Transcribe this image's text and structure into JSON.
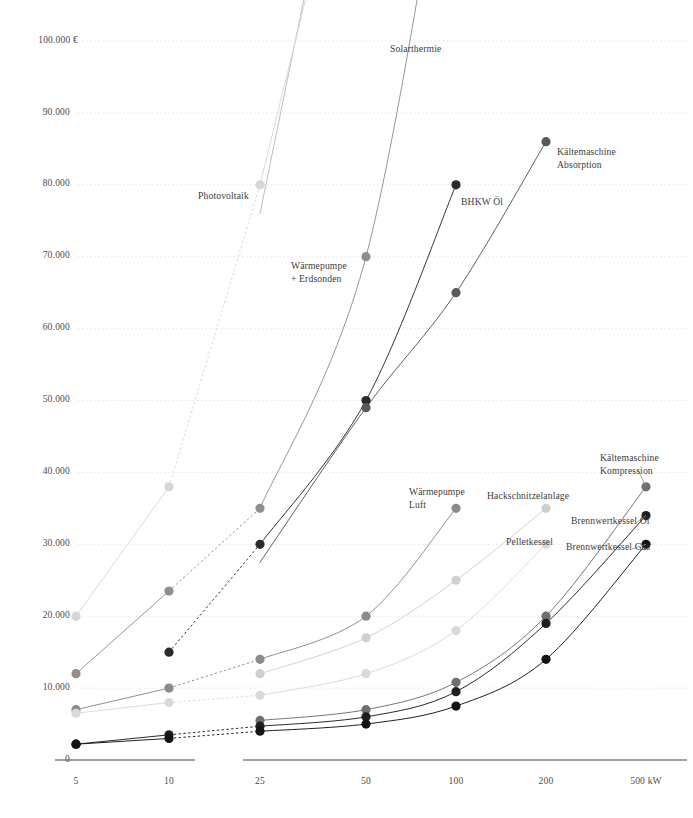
{
  "chart_data": {
    "type": "line",
    "title": "",
    "xlabel": "",
    "ylabel": "",
    "currency_symbol": "€",
    "y_axis": {
      "ticks": [
        0,
        10000,
        20000,
        30000,
        40000,
        50000,
        60000,
        70000,
        80000,
        90000,
        100000
      ],
      "tick_labels": [
        "0",
        "10.000",
        "20.000",
        "30.000",
        "40.000",
        "50.000",
        "60.000",
        "70.000",
        "80.000",
        "90.000",
        "100.000 €"
      ],
      "ylim": [
        0,
        100000
      ],
      "grid": true
    },
    "x_axis": {
      "categories": [
        "5",
        "10",
        "25",
        "50",
        "100",
        "200",
        "500"
      ],
      "tick_labels": [
        "5",
        "10",
        "25",
        "50",
        "100",
        "200",
        "500 kW"
      ],
      "unit": "kW",
      "break_after_index": 1,
      "grid": false
    },
    "legend": {
      "position": "inline-annotations"
    },
    "series": [
      {
        "name": "Solarthermie",
        "color": "#b9b9b9",
        "label_pos": {
          "x": 390,
          "y": 43
        },
        "points": [
          {
            "x": "25",
            "y": 76000
          },
          {
            "x": "50",
            "y": 148000
          }
        ],
        "visible_points": []
      },
      {
        "name": "Photovoltaik",
        "color": "#d6d6d6",
        "label_pos": {
          "x": 198,
          "y": 190
        },
        "points": [
          {
            "x": "5",
            "y": 20000
          },
          {
            "x": "10",
            "y": 38000
          },
          {
            "x": "25",
            "y": 80000
          },
          {
            "x": "50",
            "y": 140000
          }
        ],
        "visible_points": [
          {
            "x": "5",
            "y": 20000
          },
          {
            "x": "10",
            "y": 38000
          },
          {
            "x": "25",
            "y": 80000
          }
        ]
      },
      {
        "name": "Wärmepumpe + Erdsonden",
        "color": "#8f8f8f",
        "label_pos": {
          "x": 291,
          "y": 262
        },
        "points": [
          {
            "x": "5",
            "y": 12000
          },
          {
            "x": "10",
            "y": 23500
          },
          {
            "x": "25",
            "y": 35000
          },
          {
            "x": "50",
            "y": 70000
          },
          {
            "x": "100",
            "y": 138000
          }
        ],
        "visible_points": [
          {
            "x": "5",
            "y": 12000
          },
          {
            "x": "10",
            "y": 23500
          },
          {
            "x": "25",
            "y": 35000
          },
          {
            "x": "50",
            "y": 70000
          }
        ]
      },
      {
        "name": "BHKW Öl",
        "color": "#2b2b2b",
        "label_pos": {
          "x": 461,
          "y": 197
        },
        "points": [
          {
            "x": "10",
            "y": 15000
          },
          {
            "x": "25",
            "y": 30000
          },
          {
            "x": "50",
            "y": 50000
          },
          {
            "x": "100",
            "y": 80000
          }
        ],
        "visible_points": [
          {
            "x": "10",
            "y": 15000
          },
          {
            "x": "25",
            "y": 30000
          },
          {
            "x": "50",
            "y": 50000
          },
          {
            "x": "100",
            "y": 80000
          }
        ]
      },
      {
        "name": "Kältemaschine Absorption",
        "color": "#585858",
        "label_pos": {
          "x": 557,
          "y": 146
        },
        "points": [
          {
            "x": "25",
            "y": 27500
          },
          {
            "x": "50",
            "y": 49000
          },
          {
            "x": "100",
            "y": 65000
          },
          {
            "x": "200",
            "y": 86000
          }
        ],
        "visible_points": [
          {
            "x": "50",
            "y": 49000
          },
          {
            "x": "100",
            "y": 65000
          },
          {
            "x": "200",
            "y": 86000
          }
        ]
      },
      {
        "name": "Wärmepumpe Luft",
        "color": "#8a8a8a",
        "label_pos": {
          "x": 409,
          "y": 488
        },
        "points": [
          {
            "x": "5",
            "y": 7000
          },
          {
            "x": "10",
            "y": 10000
          },
          {
            "x": "25",
            "y": 14000
          },
          {
            "x": "50",
            "y": 20000
          },
          {
            "x": "100",
            "y": 35000
          }
        ],
        "visible_points": [
          {
            "x": "5",
            "y": 7000
          },
          {
            "x": "10",
            "y": 10000
          },
          {
            "x": "25",
            "y": 14000
          },
          {
            "x": "50",
            "y": 20000
          },
          {
            "x": "100",
            "y": 35000
          }
        ]
      },
      {
        "name": "Hackschnitzelanlage",
        "color": "#cfcfcf",
        "label_pos": {
          "x": 487,
          "y": 492
        },
        "points": [
          {
            "x": "25",
            "y": 12000
          },
          {
            "x": "50",
            "y": 17000
          },
          {
            "x": "100",
            "y": 25000
          },
          {
            "x": "200",
            "y": 35000
          }
        ],
        "visible_points": [
          {
            "x": "25",
            "y": 12000
          },
          {
            "x": "50",
            "y": 17000
          },
          {
            "x": "100",
            "y": 25000
          },
          {
            "x": "200",
            "y": 35000
          }
        ]
      },
      {
        "name": "Pelletkessel",
        "color": "#d9d9d9",
        "label_pos": {
          "x": 506,
          "y": 538
        },
        "points": [
          {
            "x": "5",
            "y": 6500
          },
          {
            "x": "10",
            "y": 8000
          },
          {
            "x": "25",
            "y": 9000
          },
          {
            "x": "50",
            "y": 12000
          },
          {
            "x": "100",
            "y": 18000
          },
          {
            "x": "200",
            "y": 30000
          }
        ],
        "visible_points": [
          {
            "x": "5",
            "y": 6500
          },
          {
            "x": "10",
            "y": 8000
          },
          {
            "x": "25",
            "y": 9000
          },
          {
            "x": "50",
            "y": 12000
          },
          {
            "x": "100",
            "y": 18000
          },
          {
            "x": "200",
            "y": 30000
          }
        ]
      },
      {
        "name": "Kältemaschine Kompression",
        "color": "#6f6f6f",
        "label_pos": {
          "x": 600,
          "y": 455
        },
        "points": [
          {
            "x": "25",
            "y": 5500
          },
          {
            "x": "50",
            "y": 7000
          },
          {
            "x": "100",
            "y": 10800
          },
          {
            "x": "200",
            "y": 20000
          },
          {
            "x": "500",
            "y": 38000
          }
        ],
        "visible_points": [
          {
            "x": "25",
            "y": 5500
          },
          {
            "x": "50",
            "y": 7000
          },
          {
            "x": "100",
            "y": 10800
          },
          {
            "x": "200",
            "y": 20000
          },
          {
            "x": "500",
            "y": 38000
          }
        ]
      },
      {
        "name": "Brennwertkessel Öl",
        "color": "#1f1f1f",
        "label_pos": {
          "x": 571,
          "y": 517
        },
        "points": [
          {
            "x": "5",
            "y": 2200
          },
          {
            "x": "10",
            "y": 3500
          },
          {
            "x": "25",
            "y": 4700
          },
          {
            "x": "50",
            "y": 6000
          },
          {
            "x": "100",
            "y": 9500
          },
          {
            "x": "200",
            "y": 19000
          },
          {
            "x": "500",
            "y": 34000
          }
        ],
        "visible_points": [
          {
            "x": "5",
            "y": 2200
          },
          {
            "x": "10",
            "y": 3500
          },
          {
            "x": "25",
            "y": 4700
          },
          {
            "x": "50",
            "y": 6000
          },
          {
            "x": "100",
            "y": 9500
          },
          {
            "x": "200",
            "y": 19000
          },
          {
            "x": "500",
            "y": 34000
          }
        ]
      },
      {
        "name": "Brennwertkessel Gas",
        "color": "#141414",
        "label_pos": {
          "x": 566,
          "y": 543
        },
        "points": [
          {
            "x": "5",
            "y": 2200
          },
          {
            "x": "10",
            "y": 3000
          },
          {
            "x": "25",
            "y": 4000
          },
          {
            "x": "50",
            "y": 5000
          },
          {
            "x": "100",
            "y": 7500
          },
          {
            "x": "200",
            "y": 14000
          },
          {
            "x": "500",
            "y": 30000
          }
        ],
        "visible_points": [
          {
            "x": "5",
            "y": 2200
          },
          {
            "x": "10",
            "y": 3000
          },
          {
            "x": "25",
            "y": 4000
          },
          {
            "x": "50",
            "y": 5000
          },
          {
            "x": "100",
            "y": 7500
          },
          {
            "x": "200",
            "y": 14000
          },
          {
            "x": "500",
            "y": 30000
          }
        ]
      }
    ]
  },
  "axis": {
    "y_tick_labels": [
      "100.000 €",
      "90.000",
      "80.000",
      "70.000",
      "60.000",
      "50.000",
      "40.000",
      "30.000",
      "20.000",
      "10.000",
      "0"
    ],
    "x_tick_labels": [
      "5",
      "10",
      "25",
      "50",
      "100",
      "200",
      "500 kW"
    ]
  },
  "labels": {
    "solarthermie": "Solarthermie",
    "photovoltaik": "Photovoltaik",
    "waermepumpe_erdsonden_l1": "Wärmepumpe",
    "waermepumpe_erdsonden_l2": "+ Erdsonden",
    "bhkw_oel": "BHKW Öl",
    "kaelte_absorption_l1": "Kältemaschine",
    "kaelte_absorption_l2": "Absorption",
    "waermepumpe_luft_l1": "Wärmepumpe",
    "waermepumpe_luft_l2": "Luft",
    "hackschnitzelanlage": "Hackschnitzelanlage",
    "kaelte_kompression_l1": "Kältemaschine",
    "kaelte_kompression_l2": "Kompression",
    "brennwertkessel_oel": "Brennwertkessel Öl",
    "pelletkessel": "Pelletkessel",
    "brennwertkessel_gas": "Brennwertkessel Gas"
  },
  "colors": {
    "background": "#ffffff",
    "grid": "#e2e2e2",
    "axis": "#555555",
    "text": "#3c3c3c"
  }
}
